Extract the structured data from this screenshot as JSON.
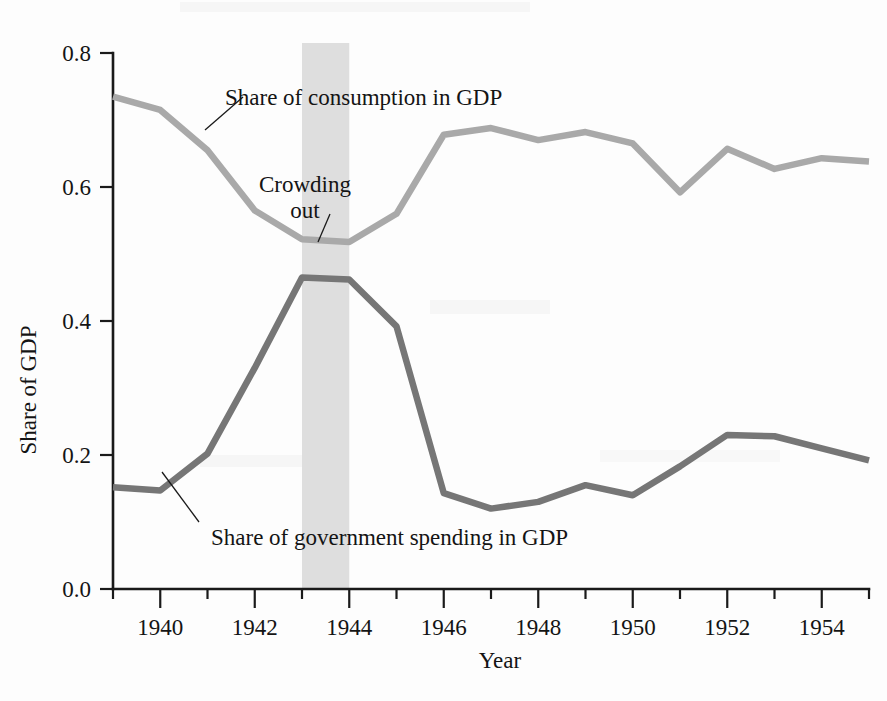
{
  "chart_data": {
    "type": "line",
    "title": "",
    "xlabel": "Year",
    "ylabel": "Share of GDP",
    "xlim": [
      1939,
      1955
    ],
    "ylim": [
      0.0,
      0.8
    ],
    "grid": false,
    "legend_position": "inline-annotations",
    "x": [
      1939,
      1940,
      1941,
      1942,
      1943,
      1944,
      1945,
      1946,
      1947,
      1948,
      1949,
      1950,
      1951,
      1952,
      1953,
      1954,
      1955
    ],
    "xticks_major": [
      1940,
      1942,
      1944,
      1946,
      1948,
      1950,
      1952,
      1954
    ],
    "xticks_minor": [
      1939,
      1941,
      1943,
      1945,
      1947,
      1949,
      1951,
      1953,
      1955
    ],
    "xtick_labels": [
      "1940",
      "1942",
      "1944",
      "1946",
      "1948",
      "1950",
      "1952",
      "1954"
    ],
    "yticks": [
      0.0,
      0.2,
      0.4,
      0.6,
      0.8
    ],
    "ytick_labels": [
      "0.0",
      "0.2",
      "0.4",
      "0.6",
      "0.8"
    ],
    "series": [
      {
        "name": "Share of consumption in GDP",
        "color": "#a9a9a9",
        "values": [
          0.735,
          0.715,
          0.655,
          0.565,
          0.522,
          0.518,
          0.56,
          0.678,
          0.688,
          0.67,
          0.682,
          0.665,
          0.592,
          0.657,
          0.627,
          0.643,
          0.638
        ]
      },
      {
        "name": "Share of government spending in GDP",
        "color": "#767676",
        "values": [
          0.152,
          0.147,
          0.202,
          0.33,
          0.465,
          0.462,
          0.392,
          0.143,
          0.12,
          0.13,
          0.155,
          0.14,
          0.183,
          0.23,
          0.228,
          0.21,
          0.192
        ]
      }
    ],
    "annotations": [
      {
        "name": "consumption-label",
        "text": "Share of consumption in GDP",
        "x": 1943.2,
        "y": 0.742
      },
      {
        "name": "crowding-out-label",
        "line1": "Crowding",
        "line2": "out",
        "x": 1943.2,
        "y": 0.615
      },
      {
        "name": "government-spending-label",
        "text": "Share of government spending in GDP",
        "x": 1945.6,
        "y": 0.092
      }
    ],
    "shaded_region": {
      "name": "crowding-out-band",
      "label": "Crowding out",
      "from": 1943,
      "to": 1944,
      "color": "#dedede"
    }
  },
  "axes": {
    "y_title": "Share of GDP",
    "x_title": "Year"
  }
}
